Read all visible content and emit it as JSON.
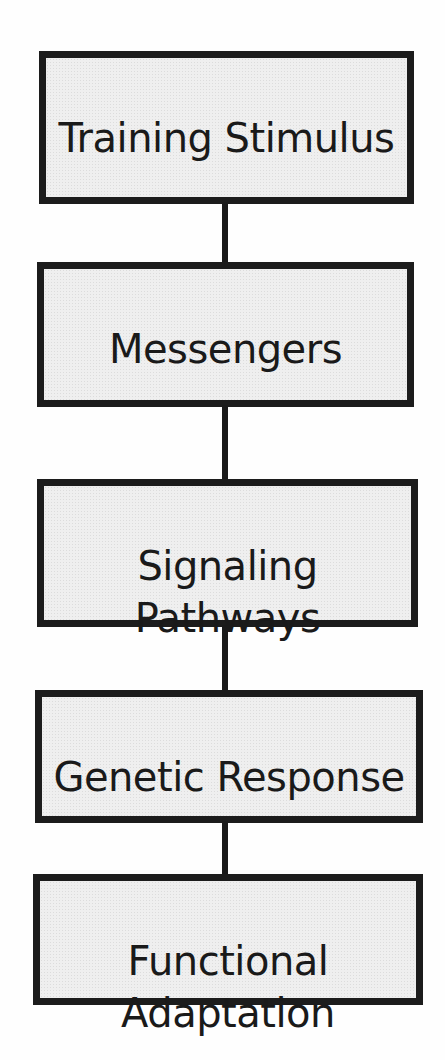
{
  "diagram": {
    "type": "flowchart",
    "direction": "top-to-bottom",
    "boxes": [
      {
        "id": "training-stimulus",
        "label": "Training Stimulus"
      },
      {
        "id": "messengers",
        "label": "Messengers"
      },
      {
        "id": "signaling-pathways",
        "label": "Signaling\nPathways"
      },
      {
        "id": "genetic-response",
        "label": "Genetic Response"
      },
      {
        "id": "functional-adaptation",
        "label": "Functional\nAdaptation"
      }
    ],
    "connections": [
      {
        "from": "training-stimulus",
        "to": "messengers"
      },
      {
        "from": "messengers",
        "to": "signaling-pathways"
      },
      {
        "from": "signaling-pathways",
        "to": "genetic-response"
      },
      {
        "from": "genetic-response",
        "to": "functional-adaptation"
      }
    ],
    "colors": {
      "box_fill": "#efefef",
      "box_border": "#1c1c1c",
      "connector": "#1a1a1a",
      "text": "#1a1a1a",
      "background": "#fefefe"
    }
  }
}
